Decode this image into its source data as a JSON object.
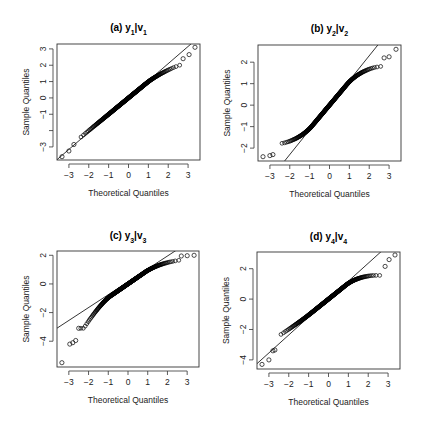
{
  "figure": {
    "width": 423,
    "height": 429,
    "point_color": "#000000",
    "line_color": "#000000",
    "frame_color": "#333333"
  },
  "chart_data": [
    {
      "type": "scatter",
      "subtype": "qq-plot",
      "panel": "a",
      "title": "(a) y1|v1",
      "title_parts": {
        "prefix": "(a) ",
        "y": "y",
        "y_sub": "1",
        "sep": "|",
        "v": "v",
        "v_sub": "1"
      },
      "xlabel": "Theoretical Quantiles",
      "ylabel": "Sample Quantiles",
      "xticks": [
        -3,
        -2,
        -1,
        0,
        1,
        2,
        3
      ],
      "xtick_labels": [
        "-3",
        "-2",
        "-1",
        "0",
        "1",
        "2",
        "3"
      ],
      "yticks": [
        -3,
        -2,
        -1,
        0,
        1,
        2,
        3
      ],
      "ytick_labels": [
        "-3",
        "",
        "-1",
        "0",
        "1",
        "2",
        "3"
      ],
      "xlim": [
        -3.6,
        3.6
      ],
      "ylim": [
        -3.8,
        3.3
      ],
      "grid": false,
      "reference_line": {
        "intercept": 0.0,
        "slope": 1.05
      },
      "shape": {
        "lower_tail": -3.6,
        "upper_tail": 3.1,
        "body_slope": 1.0,
        "upper_bend": 0.25,
        "lower_bend": 0.0
      },
      "outliers": [
        [
          -3.35,
          -3.6
        ],
        [
          -3.0,
          -3.25
        ],
        [
          -2.75,
          -2.85
        ],
        [
          2.75,
          2.4
        ],
        [
          3.05,
          2.65
        ],
        [
          3.35,
          3.1
        ]
      ]
    },
    {
      "type": "scatter",
      "subtype": "qq-plot",
      "panel": "b",
      "title": "(b) y2|v2",
      "title_parts": {
        "prefix": "(b) ",
        "y": "y",
        "y_sub": "2",
        "sep": "|",
        "v": "v",
        "v_sub": "2"
      },
      "xlabel": "Theoretical Quantiles",
      "ylabel": "Sample Quantiles",
      "xticks": [
        -3,
        -2,
        -1,
        0,
        1,
        2,
        3
      ],
      "xtick_labels": [
        "-3",
        "-2",
        "-1",
        "0",
        "1",
        "2",
        "3"
      ],
      "yticks": [
        -2,
        -1,
        0,
        1,
        2
      ],
      "ytick_labels": [
        "-2",
        "-1",
        "0",
        "1",
        "2"
      ],
      "xlim": [
        -3.6,
        3.6
      ],
      "ylim": [
        -2.6,
        2.8
      ],
      "grid": false,
      "reference_line": {
        "intercept": 0.0,
        "slope": 1.15
      },
      "shape": {
        "lower_tail": -2.35,
        "upper_tail": 2.3,
        "body_slope": 1.1,
        "upper_bend": 0.45,
        "lower_bend": 0.45
      },
      "outliers": [
        [
          -3.35,
          -2.4
        ],
        [
          -3.0,
          -2.35
        ],
        [
          -2.85,
          -2.3
        ],
        [
          2.75,
          2.2
        ],
        [
          3.0,
          2.25
        ],
        [
          3.35,
          2.6
        ]
      ]
    },
    {
      "type": "scatter",
      "subtype": "qq-plot",
      "panel": "c",
      "title": "(c) y3|v3",
      "title_parts": {
        "prefix": "(c) ",
        "y": "y",
        "y_sub": "3",
        "sep": "|",
        "v": "v",
        "v_sub": "3"
      },
      "xlabel": "Theoretical Quantiles",
      "ylabel": "Sample Quantiles",
      "xticks": [
        -3,
        -2,
        -1,
        0,
        1,
        2,
        3
      ],
      "xtick_labels": [
        "-3",
        "-2",
        "-1",
        "0",
        "1",
        "2",
        "3"
      ],
      "yticks": [
        -4,
        -2,
        0,
        2
      ],
      "ytick_labels": [
        "-4",
        "-2",
        "0",
        "2"
      ],
      "xlim": [
        -3.6,
        3.6
      ],
      "ylim": [
        -5.8,
        2.3
      ],
      "grid": false,
      "reference_line": {
        "intercept": 0.15,
        "slope": 0.9
      },
      "shape": {
        "lower_tail": -3.1,
        "upper_tail": 1.95,
        "body_slope": 0.95,
        "upper_bend": 0.35,
        "lower_bend": -0.6
      },
      "outliers": [
        [
          -3.35,
          -5.5
        ],
        [
          -2.95,
          -4.2
        ],
        [
          -2.8,
          -4.1
        ],
        [
          -2.65,
          -3.95
        ],
        [
          -2.5,
          -3.1
        ],
        [
          2.7,
          1.95
        ],
        [
          3.0,
          1.97
        ],
        [
          3.35,
          2.0
        ]
      ]
    },
    {
      "type": "scatter",
      "subtype": "qq-plot",
      "panel": "d",
      "title": "(d) y4|v4",
      "title_parts": {
        "prefix": "(d) ",
        "y": "y",
        "y_sub": "4",
        "sep": "|",
        "v": "v",
        "v_sub": "4"
      },
      "xlabel": "Theoretical Quantiles",
      "ylabel": "Sample Quantiles",
      "xticks": [
        -3,
        -2,
        -1,
        0,
        1,
        2,
        3
      ],
      "xtick_labels": [
        "-3",
        "-2",
        "-1",
        "0",
        "1",
        "2",
        "3"
      ],
      "yticks": [
        -4,
        -2,
        0,
        2
      ],
      "ytick_labels": [
        "-4",
        "-2",
        "0",
        "2"
      ],
      "xlim": [
        -3.6,
        3.6
      ],
      "ylim": [
        -4.6,
        3.1
      ],
      "grid": false,
      "reference_line": {
        "intercept": 0.0,
        "slope": 1.18
      },
      "shape": {
        "lower_tail": -3.3,
        "upper_tail": 2.1,
        "body_slope": 1.05,
        "upper_bend": 0.5,
        "lower_bend": 0.1
      },
      "outliers": [
        [
          -3.35,
          -4.3
        ],
        [
          -3.0,
          -4.0
        ],
        [
          -2.8,
          -3.4
        ],
        [
          -2.7,
          -3.35
        ],
        [
          2.85,
          2.15
        ],
        [
          3.05,
          2.6
        ],
        [
          3.35,
          2.9
        ]
      ]
    }
  ],
  "panels_px": [
    {
      "left": 57,
      "top": 44,
      "right": 200,
      "bottom": 160,
      "title_y": 27
    },
    {
      "left": 258,
      "top": 45,
      "right": 401,
      "bottom": 161,
      "title_y": 28
    },
    {
      "left": 57,
      "top": 251,
      "right": 199,
      "bottom": 367,
      "title_y": 235
    },
    {
      "left": 257,
      "top": 252,
      "right": 400,
      "bottom": 369,
      "title_y": 236
    }
  ]
}
